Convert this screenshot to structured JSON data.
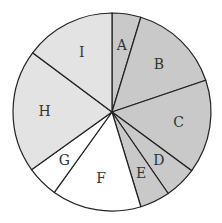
{
  "chart_data": {
    "type": "pie",
    "title": "",
    "start_angle_deg": 0,
    "direction": "clockwise",
    "categories": [
      "A",
      "B",
      "C",
      "D",
      "E",
      "F",
      "G",
      "H",
      "I"
    ],
    "values": [
      4.7,
      15.1,
      15.3,
      5.3,
      4.9,
      14.6,
      5.2,
      20.1,
      14.8
    ],
    "colors": [
      "#c9c9c9",
      "#c9c9c9",
      "#c9c9c9",
      "#c9c9c9",
      "#c9c9c9",
      "#ffffff",
      "#ffffff",
      "#e3e3e3",
      "#e3e3e3"
    ],
    "labels": [
      "A",
      "B",
      "C",
      "D",
      "E",
      "F",
      "G",
      "H",
      "I"
    ],
    "legend": "none",
    "units": "percent (estimated)"
  },
  "geometry": {
    "cx": 112,
    "cy": 112,
    "r": 99,
    "label_r": 0.68
  },
  "style": {
    "stroke": "#222222"
  }
}
